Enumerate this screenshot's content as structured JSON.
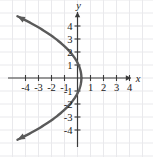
{
  "figure": {
    "background_color": "#ffffff",
    "width": 153,
    "height": 157
  },
  "chart_data": {
    "type": "line",
    "title": "",
    "subtitle": "",
    "xlabel": "x",
    "ylabel": "y",
    "xlim": [
      -5.9,
      5.8
    ],
    "ylim": [
      -6.0,
      6.0
    ],
    "grid": true,
    "grid_color": "#e9e9ec",
    "grid_step": 1,
    "legend": "none",
    "axis_color": "#3a3a3a",
    "curve_color": "#5a5a5a",
    "equation": "x = 0.3 - 0.22 y^2",
    "vertex": [
      0.3,
      0
    ],
    "opens": "left",
    "x_ticks": [
      -4,
      -3,
      -2,
      -1,
      1,
      2,
      3,
      4
    ],
    "x_tick_labels": [
      "-4",
      "-3",
      "-2",
      "-1",
      "1",
      "2",
      "3",
      "4"
    ],
    "y_ticks": [
      4,
      3,
      2,
      1,
      -1,
      -2,
      -3,
      -4
    ],
    "y_tick_labels": [
      "4",
      "3",
      "2",
      "1",
      "-1",
      "-2",
      "-3",
      "-4"
    ],
    "series": [
      {
        "name": "parabola-upper-branch",
        "x": [
          0.3,
          0.25,
          0.08,
          -0.2,
          -0.58,
          -1.08,
          -1.68,
          -2.38,
          -3.2,
          -4.1,
          -4.62
        ],
        "y": [
          0.0,
          0.48,
          1.0,
          1.5,
          2.0,
          2.5,
          3.0,
          3.5,
          4.0,
          4.5,
          4.75
        ]
      },
      {
        "name": "parabola-lower-branch",
        "x": [
          0.3,
          0.25,
          0.08,
          -0.2,
          -0.58,
          -1.08,
          -1.68,
          -2.38,
          -3.2,
          -4.1,
          -4.62
        ],
        "y": [
          0.0,
          -0.48,
          -1.0,
          -1.5,
          -2.0,
          -2.5,
          -3.0,
          -3.5,
          -4.0,
          -4.5,
          -4.75
        ]
      }
    ]
  },
  "axes": {
    "x_axis_label": "x",
    "y_axis_label": "y",
    "x_tick_labels": [
      "-4",
      "-3",
      "-2",
      "-1",
      "1",
      "2",
      "3",
      "4"
    ],
    "y_tick_labels": [
      "4",
      "3",
      "2",
      "1",
      "-1",
      "-2",
      "-3",
      "-4"
    ]
  }
}
